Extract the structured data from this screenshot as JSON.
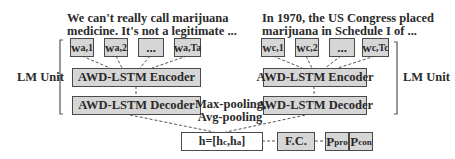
{
  "left_unit": {
    "caption_line1": "We can't really call marijuana",
    "caption_line2": "medicine.  It's not a legitimate ...",
    "words": [
      {
        "base": "w",
        "sub": "a,1"
      },
      {
        "base": "w",
        "sub": "a,2"
      },
      {
        "base": "...",
        "sub": ""
      },
      {
        "base": "w",
        "sub": "a,Ta"
      }
    ],
    "encoder_label": "AWD-LSTM Encoder",
    "decoder_label": "AWD-LSTM Decoder",
    "bracket_label": "LM Unit"
  },
  "right_unit": {
    "caption_line1": "In 1970, the US Congress placed",
    "caption_line2": "marijuana  in Schedule I of ...",
    "words": [
      {
        "base": "w",
        "sub": "c,1"
      },
      {
        "base": "w",
        "sub": "c,2"
      },
      {
        "base": "...",
        "sub": ""
      },
      {
        "base": "w",
        "sub": "c,Tc"
      }
    ],
    "encoder_label": "AWD-LSTM Encoder",
    "decoder_label": "AWD-LSTM Decoder",
    "bracket_label": "LM Unit"
  },
  "pooling": {
    "line1": "Max-pooling,",
    "line2": "Avg-pooling"
  },
  "concat": {
    "prefix": "h=[h",
    "sub1": "c",
    "mid": ",h",
    "sub2": "a",
    "suffix": "]"
  },
  "fc_label": "F.C.",
  "outputs": [
    {
      "base": "P",
      "sub": "pro"
    },
    {
      "base": "P",
      "sub": "con"
    }
  ],
  "colors": {
    "box_fill": "#d6d6d6",
    "box_border": "#4a4a4a",
    "text": "#2a2a2a",
    "background": "#ffffff"
  }
}
